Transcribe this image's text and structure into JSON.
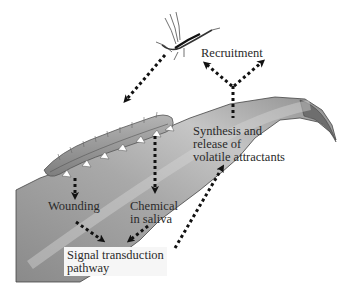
{
  "diagram": {
    "labels": {
      "recruitment": "Recruitment",
      "synthesis_line1": "Synthesis and",
      "synthesis_line2": "release of",
      "synthesis_line3": "volatile attractants",
      "wounding": "Wounding",
      "chemical_line1": "Chemical",
      "chemical_line2": "in saliva",
      "signal_line1": "Signal transduction",
      "signal_line2": "pathway"
    },
    "elements": [
      "wasp",
      "caterpillar",
      "leaf"
    ],
    "colors": {
      "leaf_dark": "#7c7c7c",
      "leaf_light": "#bdbdbd",
      "caterpillar": "#9a9a9a",
      "arrow": "#111111",
      "label_box": "#f6f6f6"
    }
  }
}
